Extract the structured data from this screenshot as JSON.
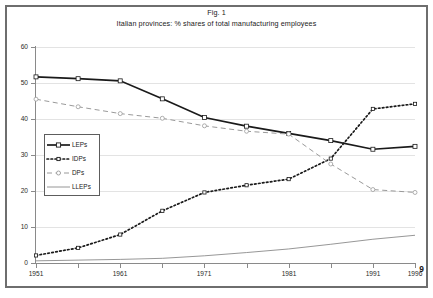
{
  "document": {
    "page_number": "9"
  },
  "figure": {
    "title_line1": "Fig. 1",
    "title_line2": "Italian provinces: % shares of total manufacturing employees"
  },
  "chart_data": {
    "type": "line",
    "title": "Fig. 1  Italian provinces: % shares of total manufacturing employees",
    "xlabel": "",
    "ylabel": "",
    "xlim": [
      1951,
      1996
    ],
    "ylim": [
      0,
      60
    ],
    "yticks": [
      0,
      10,
      20,
      30,
      40,
      50,
      60
    ],
    "xticks": [
      1951,
      1956,
      1961,
      1966,
      1971,
      1976,
      1981,
      1986,
      1991,
      1996
    ],
    "xtick_labels": [
      "1951",
      "",
      "1961",
      "",
      "1971",
      "",
      "1981",
      "",
      "1991",
      "1996"
    ],
    "grid": true,
    "legend_position": "center-left-inside",
    "x": [
      1951,
      1956,
      1961,
      1966,
      1971,
      1976,
      1981,
      1986,
      1991,
      1996
    ],
    "series": [
      {
        "name": "LEPs",
        "style": "solid",
        "color": "#1a1a1a",
        "marker": "square",
        "values": [
          51.7,
          51.2,
          50.6,
          45.6,
          40.4,
          38.0,
          36.0,
          34.0,
          31.6,
          32.4
        ]
      },
      {
        "name": "IDPs",
        "style": "dotted",
        "color": "#1a1a1a",
        "marker": "square-small",
        "values": [
          2.1,
          4.2,
          7.9,
          14.5,
          19.6,
          21.6,
          23.3,
          29.0,
          42.8,
          44.2
        ]
      },
      {
        "name": "DPs",
        "style": "dashed",
        "color": "#9a9a9a",
        "marker": "circle",
        "values": [
          45.5,
          43.4,
          41.5,
          40.2,
          38.1,
          36.6,
          35.8,
          27.5,
          20.4,
          19.6
        ]
      },
      {
        "name": "LLEPs",
        "style": "solid-thin",
        "color": "#7c7c7c",
        "marker": "none",
        "values": [
          0.6,
          0.8,
          1.0,
          1.3,
          2.0,
          2.9,
          3.9,
          5.2,
          6.6,
          7.7
        ]
      }
    ],
    "legend": [
      "LEPs",
      "IDPs",
      "DPs",
      "LLEPs"
    ]
  }
}
